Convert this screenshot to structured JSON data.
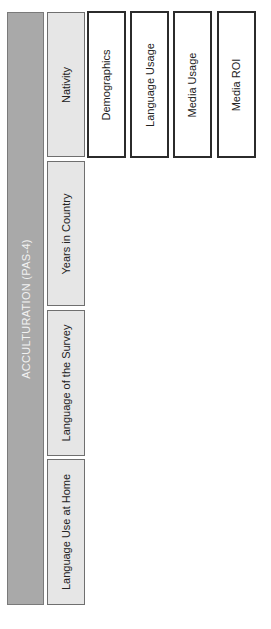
{
  "header": {
    "label": "ACCULTURATION (PAS-4)",
    "color": "#a9a9a9"
  },
  "sub_items": [
    {
      "label": "Nativity"
    },
    {
      "label": "Years in Country"
    },
    {
      "label": "Language of the Survey"
    },
    {
      "label": "Language Use at Home"
    }
  ],
  "side_items": [
    {
      "label": "Demographics"
    },
    {
      "label": "Language Usage"
    },
    {
      "label": "Media Usage"
    },
    {
      "label": "Media ROI"
    }
  ]
}
